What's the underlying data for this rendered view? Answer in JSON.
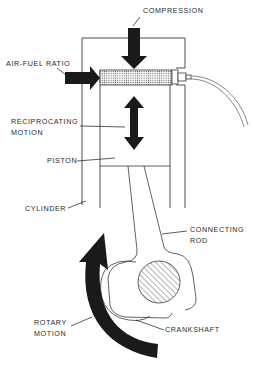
{
  "diagram": {
    "labels": {
      "compression": "COMPRESSION",
      "air_fuel_ratio": "AIR-FUEL RATIO",
      "reciprocating_motion_1": "RECIPROCATING",
      "reciprocating_motion_2": "MOTION",
      "piston": "PISTON",
      "cylinder": "CYLINDER",
      "connecting_rod_1": "CONNECTING",
      "connecting_rod_2": "ROD",
      "rotary_motion_1": "ROTARY",
      "rotary_motion_2": "MOTION",
      "crankshaft": "CRANKSHAFT"
    },
    "colors": {
      "ink": "#1a1a1a",
      "line": "#3a3a3a",
      "background": "#ffffff"
    }
  }
}
